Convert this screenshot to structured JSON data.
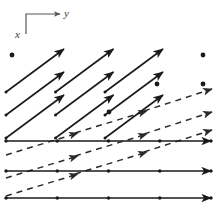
{
  "figure": {
    "width": 217,
    "height": 206,
    "background": "#ffffff",
    "ink_color": "#1a1a1a",
    "axis_color": "#555555"
  },
  "axes": {
    "name": "axis-indicator",
    "corner": {
      "x": 26,
      "y": 14
    },
    "y_axis": {
      "label": "y",
      "from": {
        "x": 26,
        "y": 14
      },
      "to": {
        "x": 62,
        "y": 14
      },
      "label_pos": {
        "x": 64,
        "y": 14
      },
      "direction": "right"
    },
    "x_axis": {
      "label": "x",
      "from": {
        "x": 26,
        "y": 14
      },
      "to": {
        "x": 26,
        "y": 34
      },
      "label_pos": {
        "x": 18,
        "y": 36
      },
      "direction": "down"
    }
  },
  "vectors": {
    "steep_solid": {
      "style": "solid",
      "label": "steep solid arrows",
      "color": "#1a1a1a",
      "width": 1.6,
      "items": [
        {
          "x1": 6,
          "y1": 92,
          "x2": 66,
          "y2": 52
        },
        {
          "x1": 6,
          "y1": 115,
          "x2": 66,
          "y2": 52
        },
        {
          "x1": 6,
          "y1": 138,
          "x2": 66,
          "y2": 52
        }
      ]
    },
    "steep_solid_rows": [
      {
        "row": 1,
        "segments": [
          {
            "x1": 6,
            "y1": 86,
            "x2": 63,
            "y2": 52
          },
          {
            "x1": 55,
            "y1": 86,
            "x2": 112,
            "y2": 52
          },
          {
            "x1": 104,
            "y1": 86,
            "x2": 161,
            "y2": 52
          }
        ]
      },
      {
        "row": 2,
        "segments": [
          {
            "x1": 6,
            "y1": 115,
            "x2": 63,
            "y2": 52
          },
          {
            "x1": 55,
            "y1": 115,
            "x2": 112,
            "y2": 52
          },
          {
            "x1": 104,
            "y1": 115,
            "x2": 161,
            "y2": 52
          }
        ]
      }
    ],
    "horizontal_solid": {
      "style": "solid",
      "label": "horizontal solid arrows",
      "color": "#1a1a1a",
      "width": 1.6,
      "tick_count": 5,
      "items": [
        {
          "x1": 6,
          "y1": 141,
          "x2": 211,
          "y2": 141
        },
        {
          "x1": 6,
          "y1": 171,
          "x2": 211,
          "y2": 171
        },
        {
          "x1": 6,
          "y1": 198,
          "x2": 211,
          "y2": 198
        }
      ]
    },
    "dashed": {
      "style": "dashed",
      "label": "dashed shallow arrows",
      "color": "#2a2a2a",
      "width": 1.5,
      "dash": "6 5",
      "items": [
        {
          "x1": 6,
          "y1": 155,
          "x2": 211,
          "y2": 98
        },
        {
          "x1": 6,
          "y1": 178,
          "x2": 211,
          "y2": 113
        },
        {
          "x1": 6,
          "y1": 191,
          "x2": 211,
          "y2": 126
        }
      ]
    }
  },
  "points": {
    "label": "isolated zero vectors",
    "color": "#1a1a1a",
    "radius": 2.4,
    "items": [
      {
        "x": 12,
        "y": 55
      },
      {
        "x": 203,
        "y": 55
      },
      {
        "x": 157,
        "y": 84
      },
      {
        "x": 203,
        "y": 84
      },
      {
        "x": 109,
        "y": 112
      }
    ]
  },
  "chart_data": {
    "type": "scatter",
    "xlabel": "y",
    "ylabel": "x",
    "grid": false,
    "legend": "none",
    "series": [
      {
        "name": "steep solid vectors",
        "style": "solid",
        "slope_deg": -42,
        "count": 9
      },
      {
        "name": "horizontal solid vectors",
        "style": "solid",
        "slope_deg": 0,
        "count": 3
      },
      {
        "name": "dashed shallow vectors",
        "style": "dashed",
        "slope_deg": -16,
        "count": 3
      },
      {
        "name": "zero vectors (points)",
        "style": "dot",
        "count": 5
      }
    ]
  }
}
